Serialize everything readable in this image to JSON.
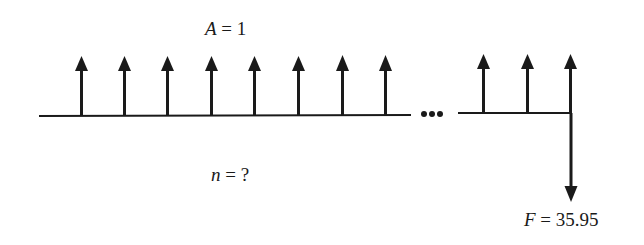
{
  "diagram": {
    "type": "cash-flow-diagram",
    "annuity_label": {
      "var": "A",
      "eq": " = ",
      "value": "1"
    },
    "periods_label": {
      "var": "n",
      "eq": " = ",
      "value": "?"
    },
    "future_label": {
      "var": "F",
      "eq": " = ",
      "value": "35.95"
    },
    "ellipsis": "•••",
    "up_arrow_count": 11,
    "down_arrow_count": 1,
    "colors": {
      "ink": "#1a1a1a",
      "background": "#ffffff"
    }
  }
}
